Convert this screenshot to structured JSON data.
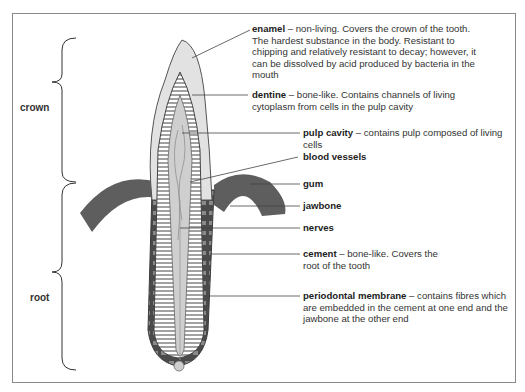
{
  "diagram": {
    "type": "labelled-cross-section",
    "subject": "tooth",
    "regions": [
      {
        "label": "crown"
      },
      {
        "label": "root"
      }
    ],
    "labels": [
      {
        "term": "enamel",
        "desc": " – non-living. Covers the crown of the tooth. The hardest substance in the body. Resistant to chipping and relatively resistant to decay; however, it can be dissolved by acid produced by bacteria in the mouth"
      },
      {
        "term": "dentine",
        "desc": " – bone-like. Contains channels of living cytoplasm from cells in the pulp cavity"
      },
      {
        "term": "pulp cavity",
        "desc": " – contains pulp composed of living cells"
      },
      {
        "term": "blood vessels",
        "desc": ""
      },
      {
        "term": "gum",
        "desc": ""
      },
      {
        "term": "jawbone",
        "desc": ""
      },
      {
        "term": "nerves",
        "desc": ""
      },
      {
        "term": "cement",
        "desc": " – bone-like. Covers the root of the tooth"
      },
      {
        "term": "periodontal membrane",
        "desc": " – contains fibres which are embedded in the cement at one end and the jawbone at the other end"
      }
    ],
    "colors": {
      "enamel": "#e2e2e2",
      "dentine": "#ffffff",
      "pulp": "#cfcfcf",
      "gum": "#5e5e5e",
      "cement": "#4a4a4a",
      "outline": "#555555",
      "frame": "#8a8a8a"
    }
  }
}
